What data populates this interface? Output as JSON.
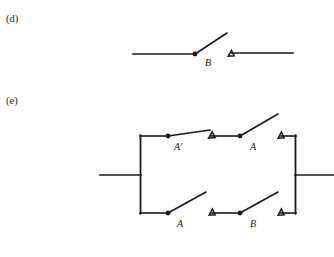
{
  "figure": {
    "background_color": "#ffffff",
    "ink_color": "#1a1a1a",
    "width": 334,
    "height": 257
  },
  "parts": [
    {
      "id": "d",
      "label": "(d)",
      "label_x": 6,
      "label_y": 22,
      "type": "single-switch",
      "rail_y": 54,
      "left_wire": {
        "x1": 133,
        "x2": 195
      },
      "right_wire": {
        "x1": 231,
        "x2": 293
      },
      "switches": [
        {
          "name": "B",
          "label": "B",
          "label_x": 205,
          "label_y": 66,
          "state": "open",
          "pivot_x": 195,
          "pivot_y": 54,
          "blade_tip_x": 227,
          "blade_tip_y": 33,
          "terminal_x": 231,
          "terminal_y": 53
        }
      ]
    },
    {
      "id": "e",
      "label": "(e)",
      "label_x": 6,
      "label_y": 104,
      "type": "parallel-series-network",
      "left_bus_x": 140,
      "right_bus_x": 296,
      "top_rail_y": 136,
      "bottom_rail_y": 213,
      "lead_y": 175,
      "left_lead": {
        "x1": 100,
        "x2": 140
      },
      "right_lead": {
        "x1": 296,
        "x2": 334
      },
      "branches": [
        {
          "position": "top",
          "rail_y": 136,
          "segments": [
            {
              "x1": 140,
              "x2": 168
            },
            {
              "x1": 211,
              "x2": 240
            },
            {
              "x1": 281,
              "x2": 296
            }
          ],
          "switches": [
            {
              "name": "A-prime",
              "label": "A′",
              "label_x": 174,
              "label_y": 150,
              "state": "nearly-closed",
              "pivot_x": 168,
              "pivot_y": 136,
              "blade_tip_x": 210,
              "blade_tip_y": 130,
              "terminal_x": 212,
              "terminal_y": 135
            },
            {
              "name": "A",
              "label": "A",
              "label_x": 250,
              "label_y": 150,
              "state": "open",
              "pivot_x": 240,
              "pivot_y": 136,
              "blade_tip_x": 278,
              "blade_tip_y": 114,
              "terminal_x": 281,
              "terminal_y": 135
            }
          ]
        },
        {
          "position": "bottom",
          "rail_y": 213,
          "segments": [
            {
              "x1": 140,
              "x2": 168
            },
            {
              "x1": 212,
              "x2": 240
            },
            {
              "x1": 281,
              "x2": 296
            }
          ],
          "switches": [
            {
              "name": "A",
              "label": "A",
              "label_x": 177,
              "label_y": 227,
              "state": "open",
              "pivot_x": 168,
              "pivot_y": 213,
              "blade_tip_x": 206,
              "blade_tip_y": 192,
              "terminal_x": 212,
              "terminal_y": 212
            },
            {
              "name": "B",
              "label": "B",
              "label_x": 250,
              "label_y": 227,
              "state": "open",
              "pivot_x": 240,
              "pivot_y": 213,
              "blade_tip_x": 278,
              "blade_tip_y": 192,
              "terminal_x": 281,
              "terminal_y": 212
            }
          ]
        }
      ]
    }
  ]
}
